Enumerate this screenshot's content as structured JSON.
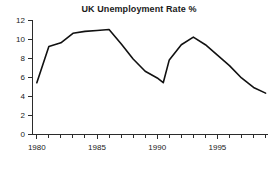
{
  "chart_data": {
    "type": "line",
    "title": "UK Unemployment Rate %",
    "xlabel": "",
    "ylabel": "",
    "xlim": [
      1979.6,
      1999.2
    ],
    "ylim": [
      0,
      12
    ],
    "grid": false,
    "legend": false,
    "x_ticks_major": [
      1980,
      1985,
      1990,
      1995
    ],
    "x_tick_labels": [
      "1980",
      "1985",
      "1990",
      "1995"
    ],
    "x_ticks_minor": [
      1981,
      1982,
      1983,
      1984,
      1986,
      1987,
      1988,
      1989,
      1991,
      1992,
      1993,
      1994,
      1996,
      1997,
      1998,
      1999
    ],
    "y_ticks": [
      0,
      2,
      4,
      6,
      8,
      10,
      12
    ],
    "y_tick_labels": [
      "0",
      "2",
      "4",
      "6",
      "8",
      "10",
      "12"
    ],
    "series": [
      {
        "name": "UK Unemployment Rate %",
        "color": "#111111",
        "x": [
          1980,
          1981,
          1982,
          1983,
          1984,
          1985,
          1986,
          1987,
          1988,
          1989,
          1990,
          1990.5,
          1991,
          1992,
          1993,
          1994,
          1995,
          1996,
          1997,
          1998,
          1999
        ],
        "values": [
          5.4,
          9.2,
          9.6,
          10.6,
          10.8,
          10.9,
          11.0,
          9.5,
          7.9,
          6.6,
          5.9,
          5.4,
          7.8,
          9.4,
          10.2,
          9.4,
          8.3,
          7.2,
          5.9,
          4.9,
          4.3
        ]
      }
    ]
  },
  "axes": {
    "axis_color": "#2b2b2b"
  }
}
